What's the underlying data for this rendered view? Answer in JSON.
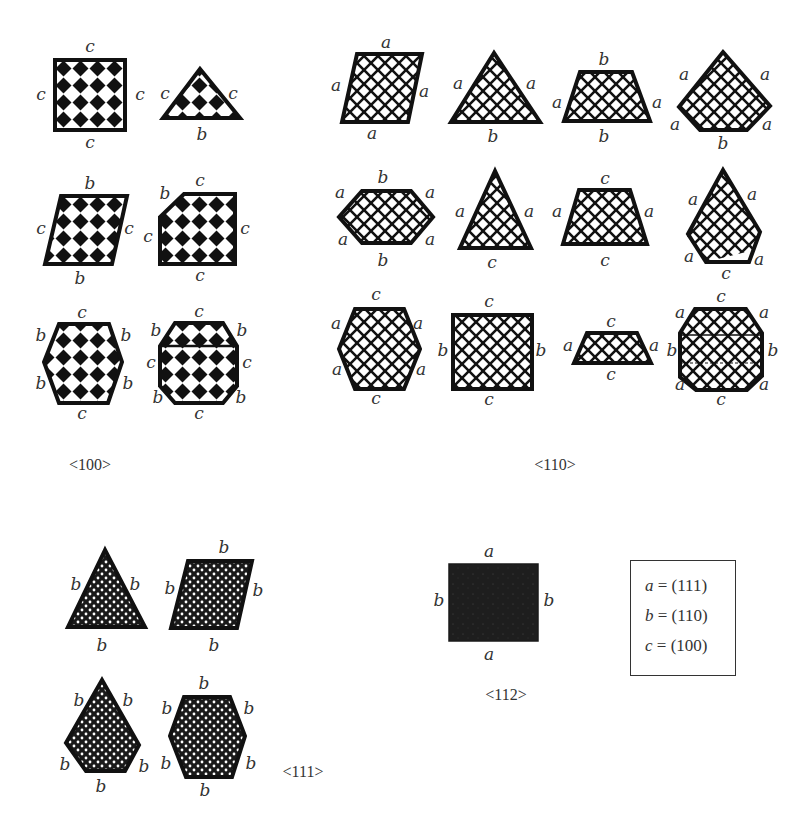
{
  "captions": {
    "group_100": "<100>",
    "group_110": "<110>",
    "group_111": "<111>",
    "group_112": "<112>"
  },
  "legend": [
    {
      "symbol": "a",
      "equals": "= (111)"
    },
    {
      "symbol": "b",
      "equals": "= (110)"
    },
    {
      "symbol": "c",
      "equals": "= (100)"
    }
  ],
  "groups": {
    "g100": {
      "pattern": "checkerboard-diamonds",
      "shapes": [
        {
          "shape": "square",
          "labels": {
            "top": "c",
            "left": "c",
            "right": "c",
            "bottom": "c"
          }
        },
        {
          "shape": "triangle",
          "labels": {
            "left": "c",
            "right": "c",
            "bottom": "b"
          }
        },
        {
          "shape": "parallelogram",
          "labels": {
            "top": "b",
            "left": "c",
            "right": "c",
            "bottom": "b"
          }
        },
        {
          "shape": "truncated-square",
          "labels": {
            "corner": "b",
            "top": "c",
            "left": "c",
            "right": "c",
            "bottom": "c"
          }
        },
        {
          "shape": "hexagon",
          "labels": {
            "top": "c",
            "upper_left": "b",
            "upper_right": "b",
            "lower_left": "b",
            "lower_right": "b",
            "bottom": "c"
          }
        },
        {
          "shape": "octagon",
          "labels": {
            "top": "c",
            "upper_left": "b",
            "upper_right": "b",
            "left": "c",
            "right": "c",
            "lower_left": "b",
            "lower_right": "b",
            "bottom": "c"
          }
        }
      ]
    },
    "g110": {
      "pattern": "crosshatch",
      "shapes": [
        {
          "shape": "rhombus",
          "labels": {
            "top": "a",
            "left": "a",
            "right": "a",
            "bottom": "a"
          }
        },
        {
          "shape": "triangle",
          "labels": {
            "left": "a",
            "right": "a",
            "bottom": "b"
          }
        },
        {
          "shape": "trapezoid",
          "labels": {
            "top": "b",
            "left": "a",
            "right": "a",
            "bottom": "b"
          }
        },
        {
          "shape": "pentagon",
          "labels": {
            "upper_left": "a",
            "upper_right": "a",
            "lower_left": "a",
            "lower_right": "a",
            "bottom": "b"
          }
        },
        {
          "shape": "hexagon-wide",
          "labels": {
            "top": "b",
            "upper_left": "a",
            "upper_right": "a",
            "lower_left": "a",
            "lower_right": "a",
            "bottom": "b"
          }
        },
        {
          "shape": "triangle-tall",
          "labels": {
            "left": "a",
            "right": "a",
            "bottom": "c"
          }
        },
        {
          "shape": "trapezoid",
          "labels": {
            "top": "c",
            "left": "a",
            "right": "a",
            "bottom": "c"
          }
        },
        {
          "shape": "pentagon-tall",
          "labels": {
            "upper_left": "a",
            "upper_right": "a",
            "lower_left": "a",
            "lower_right": "a",
            "bottom": "c"
          }
        },
        {
          "shape": "hexagon-tall",
          "labels": {
            "top": "c",
            "upper_left": "a",
            "upper_right": "a",
            "lower_left": "a",
            "lower_right": "a",
            "bottom": "c"
          }
        },
        {
          "shape": "rectangle",
          "labels": {
            "top": "c",
            "left": "b",
            "right": "b",
            "bottom": "c"
          }
        },
        {
          "shape": "trapezoid-flat",
          "labels": {
            "top": "c",
            "left": "a",
            "right": "a",
            "bottom": "c"
          }
        },
        {
          "shape": "octagon",
          "labels": {
            "top": "c",
            "upper_left": "a",
            "upper_right": "a",
            "left": "b",
            "right": "b",
            "lower_left": "a",
            "lower_right": "a",
            "bottom": "c"
          }
        }
      ]
    },
    "g111": {
      "pattern": "dense-dots",
      "shapes": [
        {
          "shape": "triangle",
          "labels": {
            "left": "b",
            "right": "b",
            "bottom": "b"
          }
        },
        {
          "shape": "rhombus",
          "labels": {
            "top": "b",
            "left": "b",
            "right": "b",
            "bottom": "b"
          }
        },
        {
          "shape": "pentagon",
          "labels": {
            "upper_left": "b",
            "upper_right": "b",
            "lower_left": "b",
            "lower_right": "b",
            "bottom": "b"
          }
        },
        {
          "shape": "hexagon",
          "labels": {
            "top": "b",
            "upper_left": "b",
            "upper_right": "b",
            "lower_left": "b",
            "lower_right": "b",
            "bottom": "b"
          }
        }
      ]
    },
    "g112": {
      "pattern": "solid",
      "shapes": [
        {
          "shape": "rectangle",
          "labels": {
            "top": "a",
            "left": "b",
            "right": "b",
            "bottom": "a"
          }
        }
      ]
    }
  }
}
